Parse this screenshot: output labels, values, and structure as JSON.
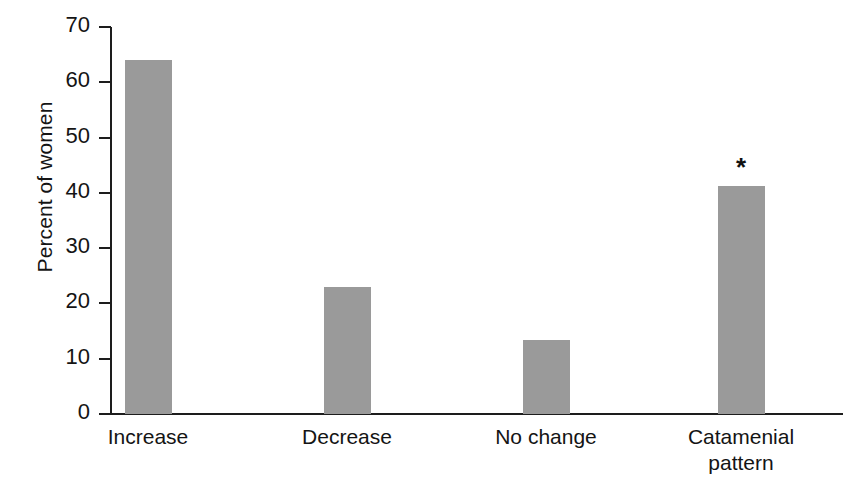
{
  "chart_data": {
    "type": "bar",
    "title": "",
    "xlabel": "",
    "ylabel": "Percent of women",
    "categories": [
      "Increase",
      "Decrease",
      "No change",
      "Catamenial pattern"
    ],
    "category_lines": [
      [
        "Increase"
      ],
      [
        "Decrease"
      ],
      [
        "No change"
      ],
      [
        "Catamenial",
        "pattern"
      ]
    ],
    "values": [
      64.0,
      23.0,
      13.3,
      41.3
    ],
    "ylim": [
      0,
      70
    ],
    "ytick_labels": [
      "70",
      "60",
      "50",
      "40",
      "30",
      "20",
      "10",
      "0"
    ],
    "ytick_values": [
      70,
      60,
      50,
      40,
      30,
      20,
      10,
      0
    ],
    "grid": false,
    "legend": null,
    "annotations": [
      {
        "category": "Catamenial pattern",
        "text": "*"
      }
    ],
    "bar_color": "#9a9a9a",
    "axis_color": "#1d1d1d",
    "background_color": "#ffffff"
  }
}
